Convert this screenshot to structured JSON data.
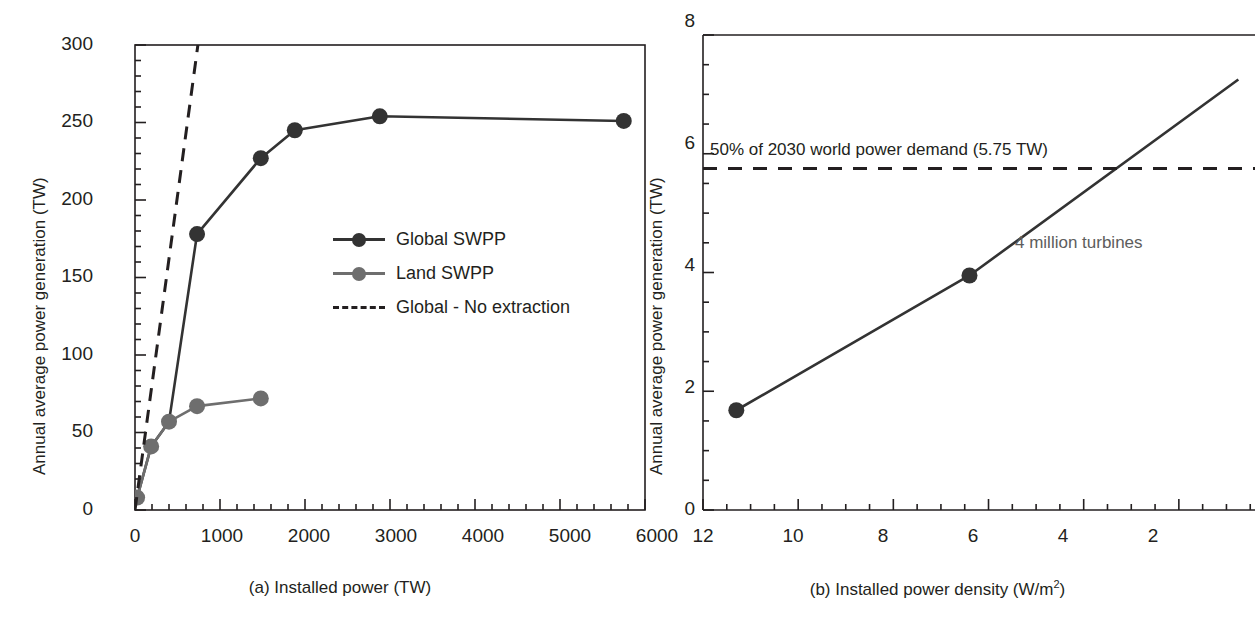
{
  "figure": {
    "panels": [
      {
        "id": "a",
        "caption": "(a) Installed power (TW)",
        "ylabel": "Annual average power generation (TW)",
        "xticks": [
          "0",
          "1000",
          "2000",
          "3000",
          "4000",
          "5000",
          "6000"
        ],
        "yticks": [
          "0",
          "50",
          "100",
          "150",
          "200",
          "250",
          "300"
        ],
        "legend": [
          {
            "label": "Global SWPP",
            "style": "line-marker",
            "color": "#333333"
          },
          {
            "label": "Land SWPP",
            "style": "line-marker",
            "color": "#6e6e6e"
          },
          {
            "label": "Global - No extraction",
            "style": "dashed",
            "color": "#231f20"
          }
        ]
      },
      {
        "id": "b",
        "caption_prefix": "(b) Installed power density (W/m",
        "caption_sup": "2",
        "caption_suffix": ")",
        "ylabel": "Annual average power generation (TW)",
        "xticks": [
          "12",
          "10",
          "8",
          "6",
          "4",
          "2"
        ],
        "yticks": [
          "0",
          "2",
          "4",
          "6",
          "8"
        ],
        "annotations": [
          {
            "name": "demand-line-label",
            "text": "50% of 2030 world power demand (5.75 TW)"
          },
          {
            "name": "turbine-count-label",
            "text": "4 million turbines"
          }
        ]
      }
    ]
  },
  "chart_data": [
    {
      "type": "line",
      "panel": "a",
      "title": "",
      "xlabel": "(a) Installed power (TW)",
      "ylabel": "Annual average power generation (TW)",
      "xlim": [
        0,
        6000
      ],
      "ylim": [
        0,
        300
      ],
      "xticks": [
        0,
        1000,
        2000,
        3000,
        4000,
        5000,
        6000
      ],
      "yticks": [
        0,
        50,
        100,
        150,
        200,
        250,
        300
      ],
      "xminor_step": 200,
      "yminor_step": 10,
      "grid": false,
      "legend_position": "center",
      "frame": "box",
      "series": [
        {
          "name": "Global SWPP",
          "color": "#333333",
          "marker": "circle",
          "linestyle": "solid",
          "x": [
            25,
            190,
            400,
            730,
            1480,
            1880,
            2880,
            5750
          ],
          "y": [
            8,
            41,
            57,
            178,
            227,
            245,
            254,
            251
          ],
          "markers_visible_from_index": 3
        },
        {
          "name": "Land SWPP",
          "color": "#6e6e6e",
          "marker": "circle",
          "linestyle": "solid",
          "x": [
            25,
            190,
            400,
            730,
            1480
          ],
          "y": [
            8,
            41,
            57,
            67,
            72
          ]
        },
        {
          "name": "Global - No extraction",
          "color": "#231f20",
          "marker": "none",
          "linestyle": "dashed",
          "x": [
            0,
            740
          ],
          "y": [
            0,
            300
          ]
        }
      ]
    },
    {
      "type": "line",
      "panel": "b",
      "title": "",
      "xlabel": "(b) Installed power density (W/m2)",
      "ylabel": "Annual average power generation (TW)",
      "xlim": [
        12,
        0.4
      ],
      "ylim": [
        0,
        8
      ],
      "xticks": [
        12,
        10,
        8,
        6,
        4,
        2
      ],
      "yticks": [
        0,
        2,
        4,
        6,
        8
      ],
      "xminor_step": 0.5,
      "yminor_step": 0.5,
      "grid": false,
      "x_reversed": true,
      "frame": "left-top",
      "series": [
        {
          "name": "Global SWPP",
          "color": "#333333",
          "marker": "circle",
          "linestyle": "solid",
          "x": [
            11.3,
            6.4,
            0.75
          ],
          "y": [
            1.68,
            3.95,
            7.25
          ]
        },
        {
          "name": "50% of 2030 world power demand",
          "color": "#231f20",
          "marker": "none",
          "linestyle": "dashed",
          "value": 5.75,
          "x": [
            12,
            0.4
          ],
          "y": [
            5.75,
            5.75
          ]
        }
      ],
      "annotations": [
        {
          "text": "50% of 2030 world power demand (5.75 TW)",
          "x": 11.4,
          "y": 6.0
        },
        {
          "text": "4 million turbines",
          "x": 3.6,
          "y": 4.45
        }
      ]
    }
  ]
}
